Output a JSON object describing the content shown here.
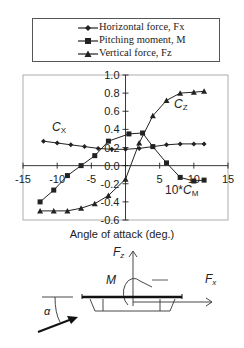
{
  "chart_data": {
    "type": "line",
    "title": "",
    "xlabel": "Angle of attack (deg.)",
    "ylabel": "",
    "xlim": [
      -15,
      15
    ],
    "ylim": [
      -0.6,
      1.0
    ],
    "xticks": [
      "-15",
      "-10",
      "-5",
      "0",
      "5",
      "10",
      "15"
    ],
    "yticks": [
      "1.0",
      "0.8",
      "0.6",
      "0.4",
      "0.2",
      "0.0",
      "-0.2",
      "-0.4",
      "-0.6"
    ],
    "grid": false,
    "legend_position": "top",
    "series": [
      {
        "name": "Horizontal force, Fx",
        "marker": "diamond",
        "annotation": "C_X",
        "x": [
          -12,
          -10,
          -8,
          -6,
          -4,
          -2,
          0,
          2,
          4,
          6,
          8,
          10,
          11.5
        ],
        "values": [
          0.27,
          0.25,
          0.23,
          0.21,
          0.19,
          0.18,
          0.18,
          0.19,
          0.21,
          0.23,
          0.24,
          0.24,
          0.24
        ]
      },
      {
        "name": "Pitching moment, M",
        "marker": "square",
        "annotation": "10*C_M",
        "x": [
          -12.5,
          -10.5,
          -8.5,
          -6.5,
          -4.5,
          -2.5,
          0.5,
          2.5,
          4,
          6,
          8,
          10,
          11.5
        ],
        "values": [
          -0.4,
          -0.27,
          -0.11,
          0.0,
          0.11,
          0.27,
          0.35,
          0.36,
          0.21,
          0.03,
          -0.13,
          -0.17,
          -0.16
        ]
      },
      {
        "name": "Vertical force, Fz",
        "marker": "triangle",
        "annotation": "C_Z",
        "x": [
          -12.5,
          -10.5,
          -8.5,
          -6.5,
          -4.5,
          -2.5,
          0,
          2,
          4,
          6,
          8,
          10,
          11.5
        ],
        "values": [
          -0.5,
          -0.5,
          -0.5,
          -0.47,
          -0.42,
          -0.33,
          -0.15,
          0.25,
          0.55,
          0.72,
          0.8,
          0.81,
          0.82
        ]
      }
    ]
  },
  "legend": {
    "items": [
      "Horizontal force, Fx",
      "Pitching moment, M",
      "Vertical force, Fz"
    ]
  },
  "annotations": {
    "cx": "C",
    "cx_sub": "X",
    "cz": "C",
    "cz_sub": "Z",
    "cm_prefix": "10*",
    "cm": "C",
    "cm_sub": "M"
  },
  "diagram": {
    "fz_label": "F",
    "fz_sub": "z",
    "fx_label": "F",
    "fx_sub": "x",
    "m_label": "M",
    "alpha_label": "α"
  }
}
